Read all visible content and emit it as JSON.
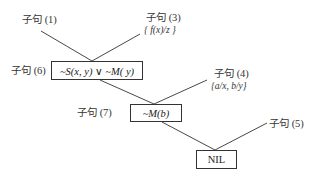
{
  "diagram": {
    "type": "resolution-refutation-tree",
    "nodes": {
      "clause1": {
        "label": "子句 (1)"
      },
      "clause3": {
        "label": "子句 (3)",
        "substitution": "{ f(x)/z }"
      },
      "clause6": {
        "label": "子句 (6)",
        "formula": "~S(x, y)  ∨ ~M( y)"
      },
      "clause4": {
        "label": "子句 (4)",
        "substitution": "{a/x, b/y}"
      },
      "clause7": {
        "label": "子句 (7)",
        "formula": "~M(b)"
      },
      "clause5": {
        "label": "子句 (5)"
      },
      "result": {
        "formula": "NIL"
      }
    },
    "edges": [
      {
        "from": "clause1",
        "to": "clause6"
      },
      {
        "from": "clause3",
        "to": "clause6"
      },
      {
        "from": "clause6",
        "to": "clause7"
      },
      {
        "from": "clause4",
        "to": "clause7"
      },
      {
        "from": "clause7",
        "to": "result"
      },
      {
        "from": "clause5",
        "to": "result"
      }
    ],
    "colors": {
      "line": "#333333",
      "text": "#222222",
      "background": "#ffffff"
    }
  }
}
